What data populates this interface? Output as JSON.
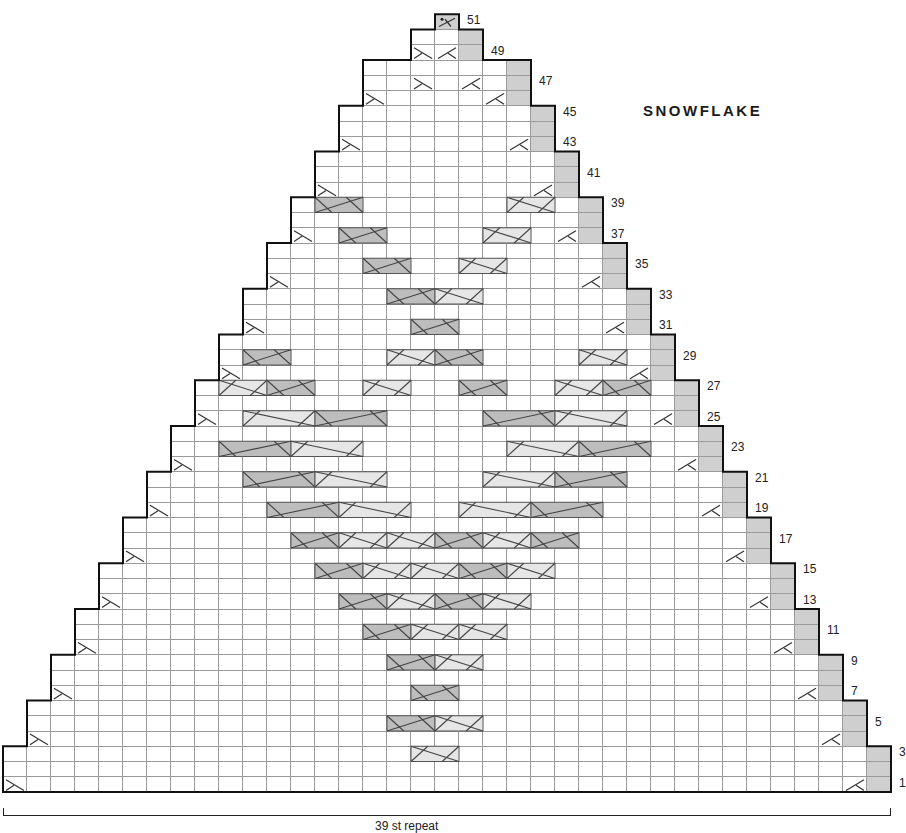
{
  "title": "SNOWFLAKE",
  "repeat_label": "39 st repeat",
  "grid": {
    "x0": 3,
    "col_w": 24,
    "bottom_y": 792,
    "row_h": 15.25
  },
  "row_labels": [
    1,
    3,
    5,
    7,
    9,
    11,
    13,
    15,
    17,
    19,
    21,
    23,
    25,
    27,
    29,
    31,
    33,
    35,
    37,
    39,
    41,
    43,
    45,
    47,
    49,
    51
  ],
  "colors": {
    "edge": "#cfcfcf",
    "cable_light": "#e6e6e6",
    "cable_dark": "#bdbdbd",
    "outline": "#111111",
    "grid": "#9a9a9a"
  },
  "cables": [
    {
      "row": 3,
      "col": 17,
      "w": 2,
      "dir": "R"
    },
    {
      "row": 5,
      "col": 16,
      "w": 2,
      "dir": "L"
    },
    {
      "row": 5,
      "col": 18,
      "w": 2,
      "dir": "R"
    },
    {
      "row": 7,
      "col": 17,
      "w": 2,
      "dir": "L"
    },
    {
      "row": 9,
      "col": 16,
      "w": 2,
      "dir": "L"
    },
    {
      "row": 9,
      "col": 18,
      "w": 2,
      "dir": "R"
    },
    {
      "row": 11,
      "col": 15,
      "w": 2,
      "dir": "L"
    },
    {
      "row": 11,
      "col": 17,
      "w": 2,
      "dir": "R"
    },
    {
      "row": 11,
      "col": 19,
      "w": 2,
      "dir": "R"
    },
    {
      "row": 13,
      "col": 14,
      "w": 2,
      "dir": "L"
    },
    {
      "row": 13,
      "col": 16,
      "w": 2,
      "dir": "R"
    },
    {
      "row": 13,
      "col": 18,
      "w": 2,
      "dir": "L"
    },
    {
      "row": 13,
      "col": 20,
      "w": 2,
      "dir": "R"
    },
    {
      "row": 15,
      "col": 13,
      "w": 2,
      "dir": "L"
    },
    {
      "row": 15,
      "col": 15,
      "w": 2,
      "dir": "R"
    },
    {
      "row": 15,
      "col": 17,
      "w": 2,
      "dir": "R"
    },
    {
      "row": 15,
      "col": 19,
      "w": 2,
      "dir": "L"
    },
    {
      "row": 15,
      "col": 21,
      "w": 2,
      "dir": "R"
    },
    {
      "row": 17,
      "col": 12,
      "w": 2,
      "dir": "L"
    },
    {
      "row": 17,
      "col": 14,
      "w": 2,
      "dir": "R"
    },
    {
      "row": 17,
      "col": 16,
      "w": 2,
      "dir": "R"
    },
    {
      "row": 17,
      "col": 18,
      "w": 2,
      "dir": "L"
    },
    {
      "row": 17,
      "col": 20,
      "w": 2,
      "dir": "R"
    },
    {
      "row": 17,
      "col": 22,
      "w": 2,
      "dir": "L"
    },
    {
      "row": 19,
      "col": 11,
      "w": 3,
      "dir": "L"
    },
    {
      "row": 19,
      "col": 14,
      "w": 3,
      "dir": "R"
    },
    {
      "row": 19,
      "col": 19,
      "w": 3,
      "dir": "R"
    },
    {
      "row": 19,
      "col": 22,
      "w": 3,
      "dir": "L"
    },
    {
      "row": 21,
      "col": 10,
      "w": 3,
      "dir": "L"
    },
    {
      "row": 21,
      "col": 13,
      "w": 3,
      "dir": "R"
    },
    {
      "row": 21,
      "col": 20,
      "w": 3,
      "dir": "R"
    },
    {
      "row": 21,
      "col": 23,
      "w": 3,
      "dir": "L"
    },
    {
      "row": 23,
      "col": 9,
      "w": 3,
      "dir": "L"
    },
    {
      "row": 23,
      "col": 12,
      "w": 3,
      "dir": "R"
    },
    {
      "row": 23,
      "col": 21,
      "w": 3,
      "dir": "R"
    },
    {
      "row": 23,
      "col": 24,
      "w": 3,
      "dir": "L"
    },
    {
      "row": 25,
      "col": 10,
      "w": 3,
      "dir": "R"
    },
    {
      "row": 25,
      "col": 13,
      "w": 3,
      "dir": "L"
    },
    {
      "row": 25,
      "col": 20,
      "w": 3,
      "dir": "L"
    },
    {
      "row": 25,
      "col": 23,
      "w": 3,
      "dir": "R"
    },
    {
      "row": 27,
      "col": 9,
      "w": 2,
      "dir": "R"
    },
    {
      "row": 27,
      "col": 11,
      "w": 2,
      "dir": "L"
    },
    {
      "row": 27,
      "col": 15,
      "w": 2,
      "dir": "R"
    },
    {
      "row": 27,
      "col": 19,
      "w": 2,
      "dir": "L"
    },
    {
      "row": 27,
      "col": 23,
      "w": 2,
      "dir": "R"
    },
    {
      "row": 27,
      "col": 25,
      "w": 2,
      "dir": "L"
    },
    {
      "row": 29,
      "col": 10,
      "w": 2,
      "dir": "L"
    },
    {
      "row": 29,
      "col": 16,
      "w": 2,
      "dir": "R"
    },
    {
      "row": 29,
      "col": 18,
      "w": 2,
      "dir": "L"
    },
    {
      "row": 29,
      "col": 24,
      "w": 2,
      "dir": "R"
    },
    {
      "row": 31,
      "col": 17,
      "w": 2,
      "dir": "L"
    },
    {
      "row": 33,
      "col": 16,
      "w": 2,
      "dir": "L"
    },
    {
      "row": 33,
      "col": 18,
      "w": 2,
      "dir": "R"
    },
    {
      "row": 35,
      "col": 15,
      "w": 2,
      "dir": "L"
    },
    {
      "row": 35,
      "col": 19,
      "w": 2,
      "dir": "R"
    },
    {
      "row": 37,
      "col": 14,
      "w": 2,
      "dir": "L"
    },
    {
      "row": 37,
      "col": 20,
      "w": 2,
      "dir": "R"
    },
    {
      "row": 39,
      "col": 13,
      "w": 2,
      "dir": "L"
    },
    {
      "row": 39,
      "col": 21,
      "w": 2,
      "dir": "R"
    }
  ]
}
